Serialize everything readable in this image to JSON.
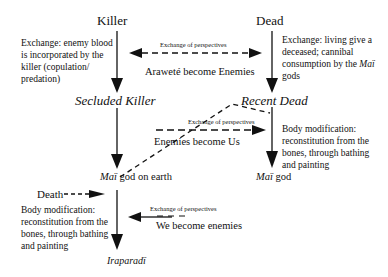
{
  "diagram": {
    "type": "flow-diagram",
    "colors": {
      "line": "#111111",
      "background": "#ffffff"
    },
    "nodes": {
      "killer": "Killer",
      "dead": "Dead",
      "secluded_killer": "Secluded Killer",
      "recent_dead": "Recent Dead",
      "mai_god_on_earth": {
        "mai": "Maï",
        "rest": " god on earth"
      },
      "mai_god": {
        "mai": "Maï",
        "rest": " god"
      },
      "iraparadi": "Iraparadï",
      "death": "Death"
    },
    "descriptions": {
      "killer_exchange": "Exchange: enemy blood is incorporated by the killer (copulation/ predation)",
      "dead_exchange": {
        "before": "Exchange: living give a deceased; cannibal consumption by the ",
        "mai": "Maï",
        "after": " gods"
      },
      "body_mod_right": "Body modification: reconstitution from the bones, through bathing and painting",
      "body_mod_left": "Body modification: reconstitution from the bones, through bathing and painting"
    },
    "exchanges": [
      {
        "label": "Exchange of perspectives",
        "caption": "Araweté become Enemies",
        "direction": "both"
      },
      {
        "label": "Exchange of perspectives",
        "caption": "Enemies become Us",
        "direction": "right"
      },
      {
        "label": "Exchange of perspectives",
        "caption": "We become enemies",
        "direction": "left"
      }
    ]
  }
}
